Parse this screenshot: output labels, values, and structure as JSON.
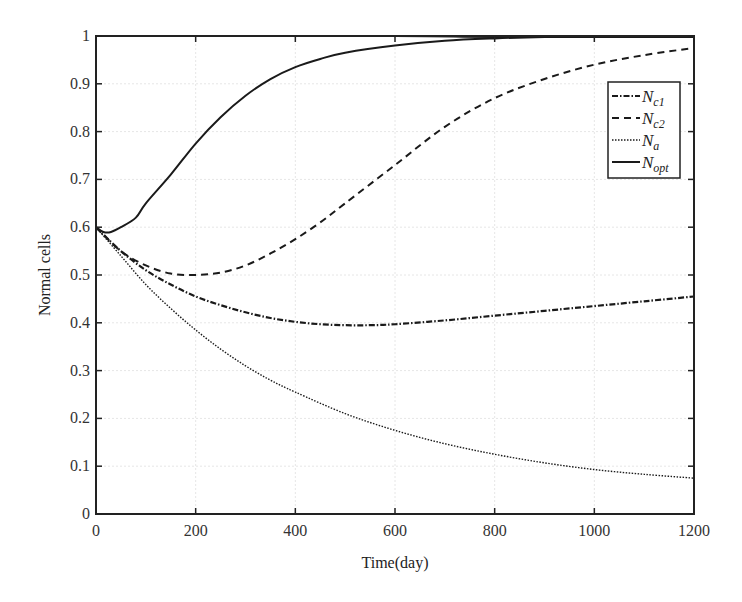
{
  "chart_data": {
    "type": "line",
    "title": "",
    "xlabel": "Time(day)",
    "ylabel": "Normal cells",
    "xlim": [
      0,
      1200
    ],
    "ylim": [
      0,
      1
    ],
    "xticks": [
      0,
      200,
      400,
      600,
      800,
      1000,
      1200
    ],
    "yticks": [
      0,
      0.1,
      0.2,
      0.3,
      0.4,
      0.5,
      0.6,
      0.7,
      0.8,
      0.9,
      1
    ],
    "grid": true,
    "legend_position": "upper right (inside, below top)",
    "series": [
      {
        "name": "N_c1",
        "label_main": "N",
        "label_sub": "c1",
        "style": "dash-dot",
        "x": [
          0,
          50,
          100,
          150,
          200,
          250,
          300,
          350,
          400,
          450,
          500,
          550,
          600,
          700,
          800,
          900,
          1000,
          1100,
          1200
        ],
        "y": [
          0.6,
          0.55,
          0.51,
          0.48,
          0.455,
          0.437,
          0.422,
          0.41,
          0.402,
          0.397,
          0.395,
          0.395,
          0.397,
          0.405,
          0.415,
          0.425,
          0.435,
          0.445,
          0.455
        ]
      },
      {
        "name": "N_c2",
        "label_main": "N",
        "label_sub": "c2",
        "style": "dashed",
        "x": [
          0,
          50,
          100,
          150,
          200,
          250,
          300,
          350,
          400,
          450,
          500,
          600,
          700,
          800,
          900,
          1000,
          1100,
          1200
        ],
        "y": [
          0.6,
          0.55,
          0.52,
          0.503,
          0.5,
          0.505,
          0.52,
          0.545,
          0.575,
          0.61,
          0.65,
          0.73,
          0.81,
          0.87,
          0.91,
          0.94,
          0.96,
          0.975
        ]
      },
      {
        "name": "N_a",
        "label_main": "N",
        "label_sub": "a",
        "style": "dotted",
        "x": [
          0,
          50,
          100,
          150,
          200,
          250,
          300,
          350,
          400,
          500,
          600,
          700,
          800,
          900,
          1000,
          1100,
          1200
        ],
        "y": [
          0.6,
          0.54,
          0.48,
          0.43,
          0.385,
          0.345,
          0.31,
          0.28,
          0.255,
          0.21,
          0.175,
          0.147,
          0.125,
          0.107,
          0.093,
          0.083,
          0.075
        ]
      },
      {
        "name": "N_opt",
        "label_main": "N",
        "label_sub": "opt",
        "style": "solid",
        "x": [
          0,
          15,
          30,
          50,
          80,
          100,
          150,
          200,
          250,
          300,
          350,
          400,
          450,
          500,
          600,
          700,
          800,
          900,
          1000,
          1200
        ],
        "y": [
          0.6,
          0.59,
          0.59,
          0.6,
          0.62,
          0.65,
          0.71,
          0.775,
          0.83,
          0.875,
          0.91,
          0.935,
          0.952,
          0.965,
          0.98,
          0.99,
          0.995,
          0.998,
          0.999,
          1.0
        ]
      },
      {
        "name": "upper envelope (unlabeled)",
        "style": "solid",
        "x": [
          0,
          600,
          800,
          1200
        ],
        "y": [
          1.0,
          1.0,
          0.998,
          0.998
        ]
      }
    ]
  },
  "colors": {
    "line": "#1a1a1a",
    "grid": "#e6e6e6",
    "axis": "#222222",
    "text": "#333333"
  },
  "legend": {
    "items": [
      {
        "main": "N",
        "sub": "c1"
      },
      {
        "main": "N",
        "sub": "c2"
      },
      {
        "main": "N",
        "sub": "a"
      },
      {
        "main": "N",
        "sub": "opt"
      }
    ]
  },
  "axes": {
    "xlabel": "Time(day)",
    "ylabel": "Normal cells"
  }
}
